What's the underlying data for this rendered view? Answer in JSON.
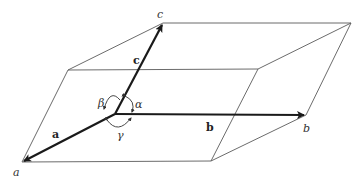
{
  "diagram": {
    "vertex_labels": {
      "a": "a",
      "b": "b",
      "c": "c"
    },
    "vector_labels": {
      "a": "a",
      "b": "b",
      "c": "c"
    },
    "angle_labels": {
      "alpha": "α",
      "beta": "β",
      "gamma": "γ"
    },
    "colors": {
      "edge": "#5a5a5a",
      "vector": "#1a1a1a",
      "background": "#ffffff"
    }
  }
}
